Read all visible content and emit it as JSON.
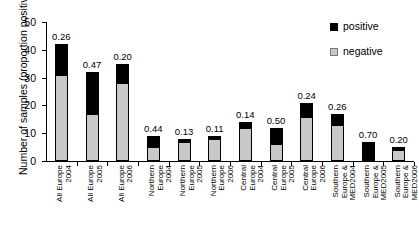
{
  "chart_data": {
    "type": "bar",
    "subtype": "stacked-bar",
    "title": "",
    "xlabel": "",
    "ylabel": "Number of samples (proportion positive)",
    "ylim": [
      0,
      50
    ],
    "yticks": [
      0,
      10,
      20,
      30,
      40,
      50
    ],
    "grid": false,
    "legend_position": "top-right",
    "legend": [
      "positive",
      "negative"
    ],
    "categories": [
      "All Europe 2004",
      "All Europe 2005",
      "All Europe 2006",
      "Northern Europe 2004",
      "Northern Europe 2005",
      "Northern Europe 2006",
      "Central Europe 2004",
      "Central Europe 2005",
      "Central Europe 2006",
      "Southern Europe & MED2004",
      "Southern Europe & MED2005",
      "Southern Europe & MED2006"
    ],
    "category_lines": [
      [
        "All Europe",
        "2004"
      ],
      [
        "All Europe",
        "2005"
      ],
      [
        "All Europe",
        "2006"
      ],
      [
        "Northern",
        "Europe",
        "2004"
      ],
      [
        "Northern",
        "Europe",
        "2005"
      ],
      [
        "Northern",
        "Europe",
        "2006"
      ],
      [
        "Central",
        "Europe",
        "2004"
      ],
      [
        "Central",
        "Europe",
        "2005"
      ],
      [
        "Central",
        "Europe",
        "2006"
      ],
      [
        "Southern",
        "Europe &",
        "MED2004"
      ],
      [
        "Southern",
        "Europe &",
        "MED2005"
      ],
      [
        "Southern",
        "Europe &",
        "MED2006"
      ]
    ],
    "series": [
      {
        "name": "negative",
        "color": "#c8c8c8",
        "values": [
          31,
          17,
          28,
          5,
          7,
          8,
          12,
          6,
          16,
          13,
          0,
          4
        ]
      },
      {
        "name": "positive",
        "color": "#000000",
        "values": [
          11,
          15,
          7,
          4,
          1,
          1,
          2,
          6,
          5,
          4,
          7,
          1
        ]
      }
    ],
    "totals": [
      42,
      32,
      35,
      9,
      8,
      9,
      14,
      12,
      21,
      17,
      7,
      5
    ],
    "data_labels": [
      "0.26",
      "0.47",
      "0.20",
      "0.44",
      "0.13",
      "0.11",
      "0.14",
      "0.50",
      "0.24",
      "0.26",
      "0.70",
      "0.20"
    ]
  },
  "colors": {
    "positive": "#000000",
    "negative": "#c8c8c8",
    "axis": "#000000",
    "background": "#ffffff"
  }
}
